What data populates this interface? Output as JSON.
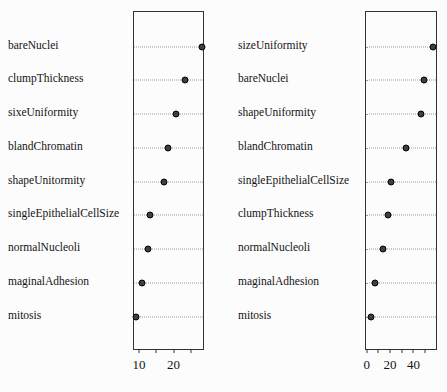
{
  "figure": {
    "background": "#fcfcfc",
    "box_color": "#333333",
    "dot_fill": "#3f3f3f",
    "dot_stroke": "#000000",
    "row_line_color": "#999999",
    "text_color": "#141414"
  },
  "chart_data": [
    {
      "type": "scatter",
      "variant": "dotchart",
      "orientation": "horizontal",
      "panel": "left",
      "title": "",
      "xlabel": "",
      "ylabel": "",
      "legend": "none",
      "grid": "dotted-row-lines",
      "categories": [
        "bareNuclei",
        "clumpThickness",
        "sixeUniformity",
        "blandChromatin",
        "shapeUnitormity",
        "singleEpithelialCellSize",
        "normalNucleoli",
        "maginalAdhesion",
        "mitosis"
      ],
      "values": [
        28.6,
        23.4,
        20.8,
        18.3,
        17.2,
        13.1,
        12.6,
        10.6,
        9.0
      ],
      "xlim": [
        8.3,
        28.8
      ],
      "xticks": [
        {
          "value": 10,
          "label": "10"
        },
        {
          "value": 15,
          "label": ""
        },
        {
          "value": 20,
          "label": "20"
        },
        {
          "value": 25,
          "label": ""
        }
      ]
    },
    {
      "type": "scatter",
      "variant": "dotchart",
      "orientation": "horizontal",
      "panel": "right",
      "title": "",
      "xlabel": "",
      "ylabel": "",
      "legend": "none",
      "grid": "dotted-row-lines",
      "categories": [
        "sizeUniformity",
        "bareNuclei",
        "shapeUniformity",
        "blandChromatin",
        "singleEpithelialCellSize",
        "clumpThickness",
        "normalNucleoli",
        "maginalAdhesion",
        "mitosis"
      ],
      "values": [
        58.0,
        49.4,
        47.4,
        33.8,
        20.8,
        17.7,
        13.3,
        6.1,
        2.6
      ],
      "xlim": [
        -1.6,
        60.3
      ],
      "xticks": [
        {
          "value": 0,
          "label": "0"
        },
        {
          "value": 10,
          "label": ""
        },
        {
          "value": 20,
          "label": "20"
        },
        {
          "value": 30,
          "label": ""
        },
        {
          "value": 40,
          "label": "40"
        },
        {
          "value": 50,
          "label": ""
        }
      ]
    }
  ]
}
